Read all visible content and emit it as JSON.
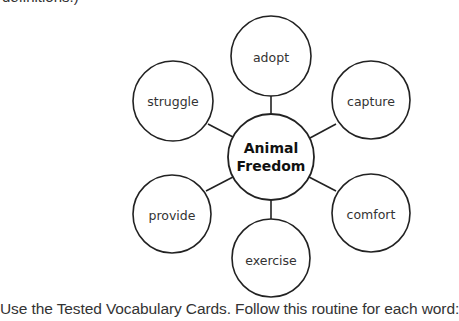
{
  "clipped_top_text": "definitions.)",
  "diagram": {
    "center": {
      "label_line1": "Animal",
      "label_line2": "Freedom",
      "cx": 271,
      "cy": 157,
      "r": 43
    },
    "nodes": [
      {
        "label": "adopt",
        "cx": 271,
        "cy": 56,
        "r": 40
      },
      {
        "label": "capture",
        "cx": 371,
        "cy": 100,
        "r": 39
      },
      {
        "label": "comfort",
        "cx": 371,
        "cy": 213,
        "r": 39
      },
      {
        "label": "exercise",
        "cx": 271,
        "cy": 258,
        "r": 39
      },
      {
        "label": "provide",
        "cx": 172,
        "cy": 214,
        "r": 39
      },
      {
        "label": "struggle",
        "cx": 173,
        "cy": 101,
        "r": 40
      }
    ],
    "stroke_color": "#222222"
  },
  "instruction": "Use the Tested Vocabulary Cards. Follow this routine for each word:"
}
